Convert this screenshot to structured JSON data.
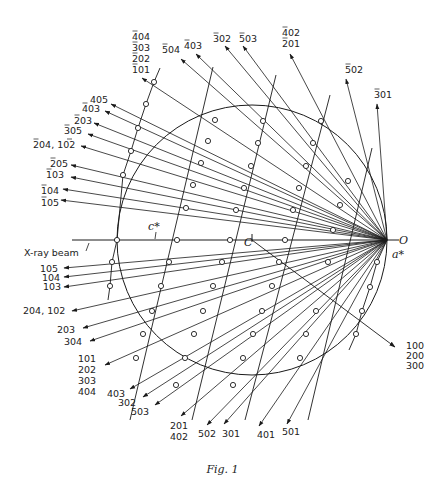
{
  "figure": {
    "caption": "Fig. 1",
    "ink_color": "#1a1a1a",
    "background": "#ffffff",
    "sphere": {
      "center": [
        252,
        240
      ],
      "radius": 135,
      "center_label": "C"
    },
    "origin": {
      "point": [
        387,
        240
      ],
      "label": "O"
    },
    "beam": {
      "label": "X-ray beam",
      "start_x": 72,
      "label_pos": [
        24,
        256
      ]
    },
    "axis_labels": {
      "c_star": {
        "text": "c*",
        "pos": [
          148,
          230
        ]
      },
      "a_star": {
        "text": "a*",
        "pos": [
          392,
          258
        ]
      }
    },
    "lattice": {
      "a_star_step": [
        -9,
        26
      ],
      "rows": [
        {
          "name": "h0 row (a*)",
          "start": [
            387,
            240
          ],
          "dx": -10,
          "dy": 26,
          "points": 4
        }
      ],
      "c_lines": [
        {
          "top": [
            213,
            67
          ],
          "bottom": [
            130,
            420
          ]
        },
        {
          "top": [
            276,
            75
          ],
          "bottom": [
            192,
            420
          ]
        },
        {
          "top": [
            330,
            95
          ],
          "bottom": [
            245,
            420
          ]
        },
        {
          "top": [
            372,
            148
          ],
          "bottom": [
            308,
            420
          ]
        }
      ],
      "nodes": [
        [
          154,
          82
        ],
        [
          146,
          104
        ],
        [
          138,
          128
        ],
        [
          131,
          151
        ],
        [
          123,
          175
        ],
        [
          117,
          240
        ],
        [
          112,
          262
        ],
        [
          110,
          286
        ],
        [
          215,
          120
        ],
        [
          208,
          141
        ],
        [
          201,
          163
        ],
        [
          193,
          185
        ],
        [
          186,
          208
        ],
        [
          177,
          240
        ],
        [
          169,
          262
        ],
        [
          161,
          286
        ],
        [
          152,
          311
        ],
        [
          143,
          334
        ],
        [
          136,
          358
        ],
        [
          263,
          121
        ],
        [
          258,
          143
        ],
        [
          251,
          166
        ],
        [
          244,
          188
        ],
        [
          236,
          210
        ],
        [
          230,
          240
        ],
        [
          222,
          262
        ],
        [
          213,
          286
        ],
        [
          203,
          311
        ],
        [
          194,
          334
        ],
        [
          185,
          358
        ],
        [
          176,
          385
        ],
        [
          321,
          121
        ],
        [
          313,
          143
        ],
        [
          306,
          166
        ],
        [
          299,
          188
        ],
        [
          293,
          210
        ],
        [
          285,
          240
        ],
        [
          279,
          262
        ],
        [
          272,
          286
        ],
        [
          262,
          311
        ],
        [
          253,
          334
        ],
        [
          243,
          358
        ],
        [
          233,
          385
        ],
        [
          348,
          181
        ],
        [
          340,
          205
        ],
        [
          333,
          230
        ],
        [
          328,
          262
        ],
        [
          316,
          311
        ],
        [
          306,
          334
        ],
        [
          300,
          358
        ],
        [
          377,
          262
        ],
        [
          370,
          287
        ],
        [
          362,
          311
        ],
        [
          356,
          334
        ]
      ]
    },
    "reflections": [
      {
        "label_lines": [
          "¯4 04",
          "¯3 03",
          "¯2 02",
          "¯1 01"
        ],
        "display": [
          "4̄0​4",
          "303",
          "202",
          "101"
        ],
        "bars": [
          true,
          true,
          true,
          false
        ],
        "end": [
          142,
          78
        ],
        "label_pos": [
          130,
          40
        ]
      },
      {
        "text": "5̄0 4",
        "end": [
          181,
          59
        ],
        "label_pos": [
          161,
          53
        ]
      },
      {
        "text": "4 0 3",
        "end": [
          196,
          54
        ],
        "label_pos": [
          185,
          49
        ]
      },
      {
        "text": "3 0 2",
        "end": [
          225,
          46
        ],
        "label_pos": [
          212,
          42
        ]
      },
      {
        "text": "5 0 3",
        "end": [
          243,
          46
        ],
        "label_pos": [
          239,
          42
        ]
      },
      {
        "text": "4 0 2 / 2 0 1",
        "end": [
          289,
          53
        ],
        "label_pos": [
          281,
          36
        ]
      },
      {
        "text": "5 0 2",
        "end": [
          346,
          79
        ],
        "label_pos": [
          345,
          74
        ]
      },
      {
        "text": "3 0 1",
        "end": [
          377,
          101
        ],
        "label_pos": [
          374,
          98
        ]
      }
    ],
    "labels_top": [
      {
        "lines": [
          "404",
          "303",
          "202",
          "101"
        ],
        "bars": [
          true,
          true,
          true,
          true
        ],
        "x": 132,
        "y": 40,
        "end": [
          142,
          78
        ]
      },
      {
        "lines": [
          "504"
        ],
        "bars": [
          true
        ],
        "x": 162,
        "y": 53,
        "end": [
          181,
          59
        ]
      },
      {
        "lines": [
          "403"
        ],
        "bars": [
          true
        ],
        "x": 184,
        "y": 49,
        "end": [
          196,
          54
        ]
      },
      {
        "lines": [
          "302"
        ],
        "bars": [
          true
        ],
        "x": 213,
        "y": 42,
        "end": [
          225,
          46
        ]
      },
      {
        "lines": [
          "503"
        ],
        "bars": [
          true
        ],
        "x": 239,
        "y": 42,
        "end": [
          243,
          46
        ]
      },
      {
        "lines": [
          "402",
          "201"
        ],
        "bars": [
          true,
          true
        ],
        "x": 282,
        "y": 36,
        "end": [
          290,
          54
        ]
      },
      {
        "lines": [
          "502"
        ],
        "bars": [
          true
        ],
        "x": 345,
        "y": 73,
        "end": [
          346,
          79
        ]
      },
      {
        "lines": [
          "301"
        ],
        "bars": [
          true
        ],
        "x": 374,
        "y": 98,
        "end": [
          377,
          104
        ]
      }
    ],
    "labels_left_upper": [
      {
        "text": "405",
        "x": 90,
        "y": 103,
        "end": [
          111,
          104
        ],
        "bar_first": false
      },
      {
        "text": "403",
        "x": 82,
        "y": 112,
        "end": [
          105,
          111
        ],
        "bar_first": true
      },
      {
        "text": "203",
        "x": 74,
        "y": 124,
        "end": [
          94,
          123
        ],
        "bar_first": true
      },
      {
        "text": "305",
        "x": 64,
        "y": 134,
        "end": [
          88,
          134
        ],
        "bar_first": true
      },
      {
        "text": "204, 102",
        "x": 33,
        "y": 148,
        "end": [
          81,
          146
        ],
        "bar_first": true,
        "bar_second": true
      },
      {
        "text": "205",
        "x": 50,
        "y": 167,
        "end": [
          71,
          165
        ],
        "bar_first": true
      },
      {
        "text": "103",
        "x": 46,
        "y": 178,
        "end": [
          71,
          177
        ],
        "bar_first": true
      },
      {
        "text": "104",
        "x": 41,
        "y": 194,
        "end": [
          63,
          189
        ],
        "bar_first": true
      },
      {
        "text": "105",
        "x": 41,
        "y": 206,
        "end": [
          61,
          200
        ],
        "bar_first": true
      }
    ],
    "labels_left_lower": [
      {
        "text": "105",
        "x": 40,
        "y": 272,
        "end": [
          64,
          268
        ]
      },
      {
        "text": "104",
        "x": 42,
        "y": 281,
        "end": [
          64,
          277
        ]
      },
      {
        "text": "103",
        "x": 43,
        "y": 290,
        "end": [
          64,
          287
        ]
      },
      {
        "text": "204, 102",
        "x": 23,
        "y": 314,
        "end": [
          72,
          311
        ]
      },
      {
        "text": "203",
        "x": 57,
        "y": 333,
        "end": [
          83,
          328
        ]
      },
      {
        "text": "304",
        "x": 64,
        "y": 345,
        "end": [
          90,
          341
        ]
      },
      {
        "text": "101\n202\n303\n404",
        "x": 78,
        "y": 362,
        "end": [
          105,
          365
        ]
      }
    ],
    "labels_bottom": [
      {
        "lines": [
          "403"
        ],
        "x": 107,
        "y": 397,
        "end": [
          130,
          389
        ]
      },
      {
        "lines": [
          "302"
        ],
        "x": 118,
        "y": 406,
        "end": [
          143,
          397
        ]
      },
      {
        "lines": [
          "503"
        ],
        "x": 131,
        "y": 415,
        "end": [
          155,
          405
        ]
      },
      {
        "lines": [
          "201",
          "402"
        ],
        "x": 170,
        "y": 429,
        "end": [
          181,
          416
        ]
      },
      {
        "lines": [
          "502"
        ],
        "x": 198,
        "y": 437,
        "end": [
          207,
          425
        ]
      },
      {
        "lines": [
          "301"
        ],
        "x": 222,
        "y": 437,
        "end": [
          224,
          424
        ]
      },
      {
        "lines": [
          "401"
        ],
        "x": 257,
        "y": 438,
        "end": [
          259,
          426
        ]
      },
      {
        "lines": [
          "501"
        ],
        "x": 282,
        "y": 435,
        "end": [
          287,
          424
        ]
      }
    ],
    "label_right": {
      "lines": [
        "100",
        "200",
        "300"
      ],
      "x": 406,
      "y": 349,
      "end": [
        395,
        347
      ]
    }
  }
}
